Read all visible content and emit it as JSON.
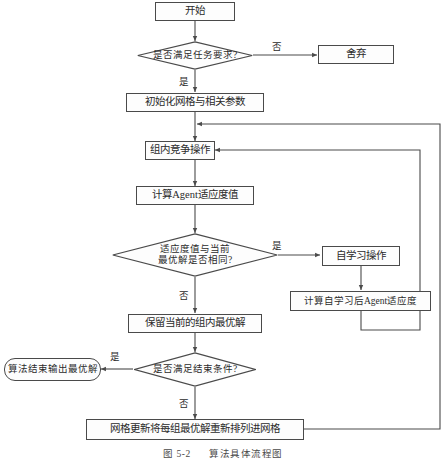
{
  "figure": {
    "caption_label": "图 5-2",
    "caption_title": "算法具体流程图",
    "colors": {
      "stroke": "#4a4a4a",
      "text": "#2b2b2b",
      "background": "#ffffff"
    }
  },
  "nodes": {
    "start": {
      "label": "开始",
      "shape": "process"
    },
    "check_task": {
      "label": "是否满足任务要求?",
      "shape": "decision"
    },
    "discard": {
      "label": "舍弃",
      "shape": "process"
    },
    "init_grid": {
      "label": "初始化网格与相关参数",
      "shape": "process"
    },
    "intra_compete": {
      "label": "组内竞争操作",
      "shape": "process"
    },
    "calc_fitness": {
      "label": "计算Agent适应度值",
      "shape": "process"
    },
    "compare_best_line1": {
      "label": "适应度值与当前",
      "shape": "decision"
    },
    "compare_best_line2": {
      "label": "最优解是否相同?",
      "shape": "decision"
    },
    "self_learning": {
      "label": "自学习操作",
      "shape": "process"
    },
    "calc_fitness_after": {
      "label": "计算自学习后Agent适应度",
      "shape": "process"
    },
    "keep_best": {
      "label": "保留当前的组内最优解",
      "shape": "process"
    },
    "check_stop": {
      "label": "是否满足结束条件?",
      "shape": "decision"
    },
    "output_best": {
      "label": "算法结束输出最优解",
      "shape": "terminator"
    },
    "grid_update": {
      "label": "网格更新将每组最优解重新排列进网格",
      "shape": "process"
    }
  },
  "edge_labels": {
    "task_no": "否",
    "task_yes": "是",
    "compare_yes": "是",
    "compare_no": "否",
    "stop_yes": "是",
    "stop_no": "否"
  }
}
